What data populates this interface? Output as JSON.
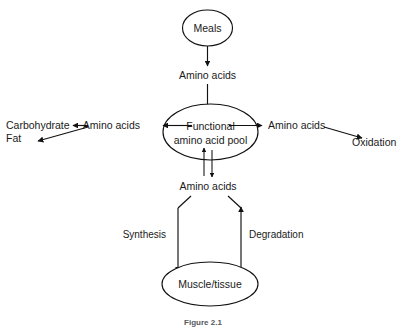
{
  "diagram": {
    "caption": "Figure 2.1",
    "colors": {
      "stroke": "#111111",
      "text": "#1a1a1a",
      "background": "#ffffff",
      "caption": "#55595c"
    },
    "nodes": {
      "meals": "Meals",
      "pool_line1": "Functional",
      "pool_line2": "amino  acid  pool",
      "muscle": "Muscle/tissue"
    },
    "flow_labels": {
      "intake": "Amino  acids",
      "left_branch": "Amino  acids",
      "right_branch": "Amino  acids",
      "turnover": "Amino  acids"
    },
    "fates": {
      "carbohydrate": "Carbohydrate",
      "fat": "Fat",
      "oxidation": "Oxidation"
    },
    "processes": {
      "synthesis": "Synthesis",
      "degradation": "Degradation"
    }
  }
}
